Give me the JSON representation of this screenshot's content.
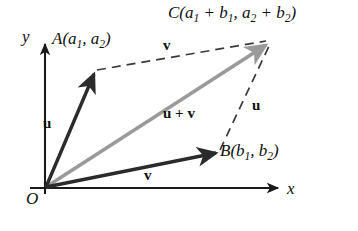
{
  "figure": {
    "background_color": "#ffffff",
    "axes": {
      "x_label": "x",
      "y_label": "y",
      "origin_label": "O",
      "axis_color": "#1a1a1a"
    },
    "points": {
      "O": {
        "label": "O",
        "x": 45,
        "y": 188
      },
      "A": {
        "label": "A",
        "x": 95,
        "y": 72,
        "coords_prefix": "A(",
        "c1": "a",
        "c1_sub": "1",
        "comma": ", ",
        "c2": "a",
        "c2_sub": "2",
        "coords_suffix": ")"
      },
      "B": {
        "label": "B",
        "x": 218,
        "y": 152,
        "coords_prefix": "B(",
        "c1": "b",
        "c1_sub": "1",
        "comma": ", ",
        "c2": "b",
        "c2_sub": "2",
        "coords_suffix": ")"
      },
      "C": {
        "label": "C",
        "x": 270,
        "y": 42,
        "coords_prefix": "C(",
        "t1a": "a",
        "t1a_sub": "1",
        "plus1": " + ",
        "t1b": "b",
        "t1b_sub": "1",
        "comma": ", ",
        "t2a": "a",
        "t2a_sub": "2",
        "plus2": " + ",
        "t2b": "b",
        "t2b_sub": "2",
        "coords_suffix": ")"
      }
    },
    "vectors": {
      "u_label": "u",
      "v_label": "v",
      "sum_label_u": "u",
      "sum_label_plus": " + ",
      "sum_label_v": "v",
      "u_color": "#2b2b2b",
      "v_color": "#2b2b2b",
      "sum_color": "#9a9a9a",
      "dashed_color": "#3a3a3a"
    }
  }
}
